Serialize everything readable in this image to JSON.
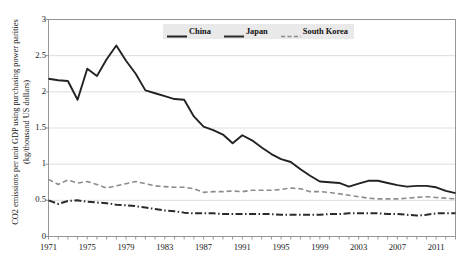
{
  "chart_data": {
    "type": "line",
    "title": "",
    "xlabel": "",
    "ylabel": "CO2 emissions per unit GDP using purchasing power parities (kg/thousand US dollars)",
    "ylabel_lines": [
      "CO2 emissions per unit GDP using purchasing power parities",
      "(kg/thousand US dollars)"
    ],
    "xlim": [
      1971,
      2013
    ],
    "ylim": [
      0,
      3
    ],
    "yticks": [
      0,
      0.5,
      1,
      1.5,
      2,
      2.5,
      3
    ],
    "ytick_labels": [
      "0",
      "0.5",
      "1",
      "1.5",
      "2",
      "2.5",
      "3"
    ],
    "xticks": [
      1971,
      1975,
      1979,
      1983,
      1987,
      1991,
      1995,
      1999,
      2003,
      2007,
      2011
    ],
    "xtick_labels": [
      "1971",
      "1975",
      "1979",
      "1983",
      "1987",
      "1991",
      "1995",
      "1999",
      "2003",
      "2007",
      "2011"
    ],
    "x": [
      1971,
      1972,
      1973,
      1974,
      1975,
      1976,
      1977,
      1978,
      1979,
      1980,
      1981,
      1982,
      1983,
      1984,
      1985,
      1986,
      1987,
      1988,
      1989,
      1990,
      1991,
      1992,
      1993,
      1994,
      1995,
      1996,
      1997,
      1998,
      1999,
      2000,
      2001,
      2002,
      2003,
      2004,
      2005,
      2006,
      2007,
      2008,
      2009,
      2010,
      2011,
      2012,
      2013
    ],
    "grid": true,
    "grid_axis": "y",
    "legend_position": "top-center",
    "series": [
      {
        "name": "China",
        "style": "solid",
        "color": "#222222",
        "values": [
          2.18,
          2.16,
          2.15,
          1.89,
          2.32,
          2.22,
          2.45,
          2.64,
          2.43,
          2.25,
          2.02,
          1.98,
          1.94,
          1.9,
          1.89,
          1.66,
          1.52,
          1.47,
          1.41,
          1.29,
          1.4,
          1.33,
          1.23,
          1.14,
          1.07,
          1.03,
          0.93,
          0.84,
          0.76,
          0.75,
          0.74,
          0.69,
          0.73,
          0.77,
          0.77,
          0.74,
          0.71,
          0.69,
          0.7,
          0.7,
          0.68,
          0.63,
          0.6
        ]
      },
      {
        "name": "Japan",
        "style": "dashdot",
        "color": "#2b2b2b",
        "values": [
          0.5,
          0.45,
          0.49,
          0.5,
          0.48,
          0.47,
          0.46,
          0.44,
          0.43,
          0.42,
          0.4,
          0.38,
          0.36,
          0.35,
          0.33,
          0.32,
          0.32,
          0.32,
          0.31,
          0.31,
          0.31,
          0.31,
          0.31,
          0.31,
          0.3,
          0.3,
          0.3,
          0.3,
          0.3,
          0.31,
          0.31,
          0.32,
          0.32,
          0.32,
          0.32,
          0.31,
          0.31,
          0.3,
          0.29,
          0.3,
          0.32,
          0.32,
          0.32
        ]
      },
      {
        "name": "South Korea",
        "style": "dashed",
        "color": "#8c8c8c",
        "values": [
          0.79,
          0.72,
          0.78,
          0.74,
          0.76,
          0.72,
          0.67,
          0.7,
          0.73,
          0.76,
          0.73,
          0.7,
          0.69,
          0.68,
          0.68,
          0.66,
          0.61,
          0.62,
          0.62,
          0.63,
          0.62,
          0.64,
          0.64,
          0.64,
          0.65,
          0.67,
          0.66,
          0.62,
          0.62,
          0.61,
          0.59,
          0.57,
          0.55,
          0.53,
          0.52,
          0.52,
          0.52,
          0.53,
          0.54,
          0.55,
          0.54,
          0.53,
          0.52
        ]
      }
    ]
  },
  "legend": {
    "items": [
      {
        "label": "China",
        "style": "solid",
        "color": "#222222"
      },
      {
        "label": "Japan",
        "style": "solid",
        "color": "#2b2b2b"
      },
      {
        "label": "South Korea",
        "style": "dashed",
        "color": "#8c8c8c"
      }
    ]
  }
}
